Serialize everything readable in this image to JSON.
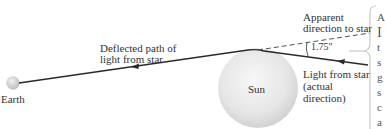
{
  "diagram": {
    "labels": {
      "earth": "Earth",
      "sun": "Sun",
      "deflected_path_line1": "Deflected path of",
      "deflected_path_line2": "light from star",
      "apparent_line1": "Apparent",
      "apparent_line2": "direction to star",
      "actual_line1": "Light from star",
      "actual_line2": "(actual",
      "actual_line3": "direction)",
      "angle": "1.75\""
    },
    "cut_off_side_text": [
      "A",
      "I",
      "t",
      "s",
      "g",
      "s",
      "c",
      "a",
      "s"
    ],
    "colors": {
      "line": "#2a2a2a",
      "dashed": "#555555",
      "sun_fill": "#e8e8e8",
      "sun_edge": "#cfcfcf",
      "earth_fill": "#d9d9d9",
      "brace": "#c8c8c8",
      "background": "#ffffff"
    }
  }
}
